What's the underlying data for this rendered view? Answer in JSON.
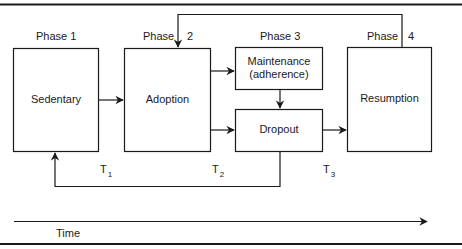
{
  "diagram": {
    "phases": [
      {
        "label": "Phase 1",
        "number": "1"
      },
      {
        "label": "Phase",
        "number": "2"
      },
      {
        "label": "Phase 3",
        "number": "3"
      },
      {
        "label": "Phase",
        "number": "4"
      }
    ],
    "boxes": {
      "sedentary": "Sedentary",
      "adoption": "Adoption",
      "maintenance_line1": "Maintenance",
      "maintenance_line2": "(adherence)",
      "dropout": "Dropout",
      "resumption": "Resumption"
    },
    "time_markers": [
      {
        "letter": "T",
        "sub": "1"
      },
      {
        "letter": "T",
        "sub": "2"
      },
      {
        "letter": "T",
        "sub": "3"
      }
    ],
    "time_axis_label": "Time",
    "colors": {
      "stroke": "#1a1a1a",
      "background": "#ffffff"
    }
  }
}
